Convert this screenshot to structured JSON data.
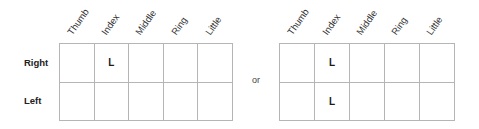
{
  "columns": [
    "Thumb",
    "Index",
    "Middle",
    "Ring",
    "Little"
  ],
  "rows": [
    "Right",
    "Left"
  ],
  "separator": "or",
  "left_grid": {
    "cells": [
      [
        "",
        "L",
        "",
        "",
        ""
      ],
      [
        "",
        "",
        "",
        "",
        ""
      ]
    ]
  },
  "right_grid": {
    "cells": [
      [
        "",
        "L",
        "",
        "",
        ""
      ],
      [
        "",
        "L",
        "",
        "",
        ""
      ]
    ]
  },
  "colors": {
    "grid_border": "#b5b5b5",
    "text": "#222222"
  }
}
